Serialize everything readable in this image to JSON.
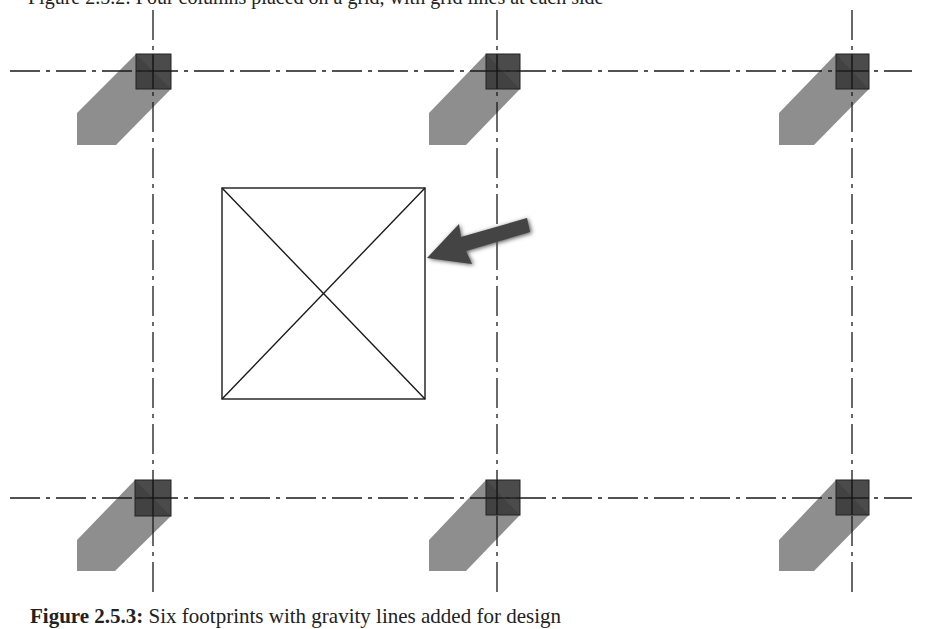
{
  "header_text": "Figure 2.5.2: Four columns placed on a grid, with grid lines at each side",
  "caption": {
    "label": "Figure 2.5.3:",
    "text": " Six footprints with gravity lines added for design"
  },
  "diagram": {
    "grid": {
      "horizontal_lines_y": [
        71,
        498
      ],
      "vertical_lines_x": [
        153,
        497,
        852
      ],
      "line_color": "#1a1a1a",
      "style": "dash-dot"
    },
    "columns": [
      {
        "id": "col-top-left",
        "x": 153,
        "y": 71
      },
      {
        "id": "col-top-middle",
        "x": 497,
        "y": 71
      },
      {
        "id": "col-top-right",
        "x": 852,
        "y": 71
      },
      {
        "id": "col-bottom-left",
        "x": 153,
        "y": 498
      },
      {
        "id": "col-bottom-middle",
        "x": 497,
        "y": 498
      },
      {
        "id": "col-bottom-right",
        "x": 852,
        "y": 498
      }
    ],
    "column_color": "#3c3c3c",
    "shadow_color": "#8e8e8e",
    "opening_box": {
      "x": 222,
      "y": 188,
      "width": 203,
      "height": 211
    },
    "arrow": {
      "from": [
        530,
        228
      ],
      "to": [
        426,
        258
      ],
      "color": "#444444"
    }
  }
}
